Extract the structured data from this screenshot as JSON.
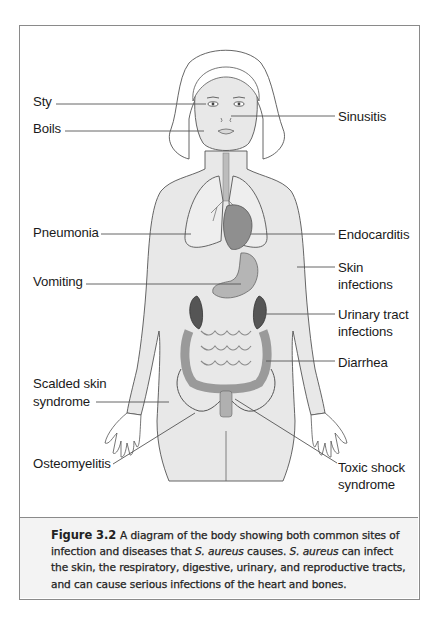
{
  "figure": {
    "labels_left": [
      {
        "id": "sty",
        "text": "Sty",
        "x": 32,
        "y": 93
      },
      {
        "id": "boils",
        "text": "Boils",
        "x": 32,
        "y": 120
      },
      {
        "id": "pneumonia",
        "text": "Pneumonia",
        "x": 32,
        "y": 224
      },
      {
        "id": "vomiting",
        "text": "Vomiting",
        "x": 32,
        "y": 273
      },
      {
        "id": "scalded-skin",
        "text": "Scalded skin",
        "x": 32,
        "y": 375
      },
      {
        "id": "scalded-skin-2",
        "text": "syndrome",
        "x": 32,
        "y": 393
      },
      {
        "id": "osteomyelitis",
        "text": "Osteomyelitis",
        "x": 32,
        "y": 455
      }
    ],
    "labels_right": [
      {
        "id": "sinusitis",
        "text": "Sinusitis",
        "x": 337,
        "y": 108
      },
      {
        "id": "endocarditis",
        "text": "Endocarditis",
        "x": 337,
        "y": 226
      },
      {
        "id": "skin-infections",
        "text": "Skin",
        "x": 337,
        "y": 259
      },
      {
        "id": "skin-infections-2",
        "text": "infections",
        "x": 337,
        "y": 276
      },
      {
        "id": "urinary-tract",
        "text": "Urinary tract",
        "x": 337,
        "y": 306
      },
      {
        "id": "urinary-tract-2",
        "text": "infections",
        "x": 337,
        "y": 323
      },
      {
        "id": "diarrhea",
        "text": "Diarrhea",
        "x": 337,
        "y": 354
      },
      {
        "id": "toxic-shock",
        "text": "Toxic shock",
        "x": 337,
        "y": 459
      },
      {
        "id": "toxic-shock-2",
        "text": "syndrome",
        "x": 337,
        "y": 476
      }
    ],
    "leader_lines": [
      {
        "for": "sty",
        "x1": 55,
        "y1": 103,
        "x2": 205,
        "y2": 103
      },
      {
        "for": "boils",
        "x1": 64,
        "y1": 130,
        "x2": 203,
        "y2": 130
      },
      {
        "for": "sinusitis",
        "x1": 230,
        "y1": 115,
        "x2": 334,
        "y2": 115
      },
      {
        "for": "pneumonia",
        "x1": 100,
        "y1": 233,
        "x2": 190,
        "y2": 233
      },
      {
        "for": "endocarditis",
        "x1": 250,
        "y1": 233,
        "x2": 334,
        "y2": 233
      },
      {
        "for": "skin-infections",
        "x1": 296,
        "y1": 266,
        "x2": 334,
        "y2": 266
      },
      {
        "for": "vomiting",
        "x1": 85,
        "y1": 283,
        "x2": 240,
        "y2": 283
      },
      {
        "for": "urinary-tract",
        "x1": 258,
        "y1": 313,
        "x2": 334,
        "y2": 313
      },
      {
        "for": "diarrhea",
        "x1": 265,
        "y1": 360,
        "x2": 334,
        "y2": 360
      },
      {
        "for": "scalded-skin",
        "x1": 95,
        "y1": 401,
        "x2": 168,
        "y2": 401
      },
      {
        "for": "osteomyelitis",
        "x1": 112,
        "y1": 463,
        "x2": 194,
        "y2": 412
      },
      {
        "for": "toxic-shock",
        "x1": 234,
        "y1": 398,
        "x2": 336,
        "y2": 462
      }
    ]
  },
  "caption": {
    "figure_number": "Figure 3.2",
    "text_parts": [
      {
        "t": "A diagram of the body showing both common sites of infection and diseases that ",
        "i": false
      },
      {
        "t": "S. aureus",
        "i": true
      },
      {
        "t": " causes. ",
        "i": false
      },
      {
        "t": "S. aureus",
        "i": true
      },
      {
        "t": " can infect the skin, the respiratory, digestive, urinary, and reproductive tracts, and can cause serious infections of the heart and bones.",
        "i": false
      }
    ]
  },
  "colors": {
    "frame_border": "#8a8a8a",
    "caption_bg": "#f3f3f3",
    "skin_fill": "#e6e6e6",
    "outline": "#555555",
    "organ_dark": "#6b6b6b",
    "organ_mid": "#a9a9a9",
    "leader_line": "#555555"
  }
}
